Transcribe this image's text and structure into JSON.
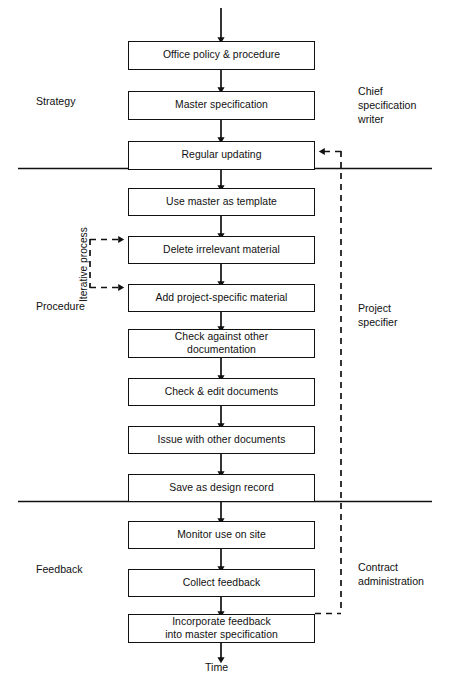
{
  "diagram": {
    "flow_axis_label": "Time",
    "iterative_label": "Iterative process",
    "phases": [
      {
        "id": "strategy",
        "label": "Strategy"
      },
      {
        "id": "procedure",
        "label": "Procedure"
      },
      {
        "id": "feedback",
        "label": "Feedback"
      }
    ],
    "roles": [
      {
        "id": "chief-specification-writer",
        "label": "Chief\nspecification\nwriter"
      },
      {
        "id": "project-specifier",
        "label": "Project\nspecifier"
      },
      {
        "id": "contract-administration",
        "label": "Contract\nadministration"
      }
    ],
    "steps": [
      {
        "id": "office-policy",
        "label": "Office policy & procedure",
        "phase": "strategy"
      },
      {
        "id": "master-specification",
        "label": "Master specification",
        "phase": "strategy"
      },
      {
        "id": "regular-updating",
        "label": "Regular updating",
        "phase": "strategy"
      },
      {
        "id": "use-master-template",
        "label": "Use master as template",
        "phase": "procedure"
      },
      {
        "id": "delete-irrelevant",
        "label": "Delete irrelevant material",
        "phase": "procedure"
      },
      {
        "id": "add-project-specific",
        "label": "Add project-specific material",
        "phase": "procedure"
      },
      {
        "id": "check-against-other",
        "label": "Check against other\ndocumentation",
        "phase": "procedure"
      },
      {
        "id": "check-edit-documents",
        "label": "Check & edit documents",
        "phase": "procedure"
      },
      {
        "id": "issue-with-other",
        "label": "Issue with other documents",
        "phase": "procedure"
      },
      {
        "id": "save-design-record",
        "label": "Save as design record",
        "phase": "procedure"
      },
      {
        "id": "monitor-use-on-site",
        "label": "Monitor use on site",
        "phase": "feedback"
      },
      {
        "id": "collect-feedback",
        "label": "Collect feedback",
        "phase": "feedback"
      },
      {
        "id": "incorporate-feedback",
        "label": "Incorporate feedback\ninto master specification",
        "phase": "feedback"
      }
    ],
    "colors": {
      "stroke": "#111111",
      "background": "#ffffff",
      "text": "#111111"
    }
  }
}
